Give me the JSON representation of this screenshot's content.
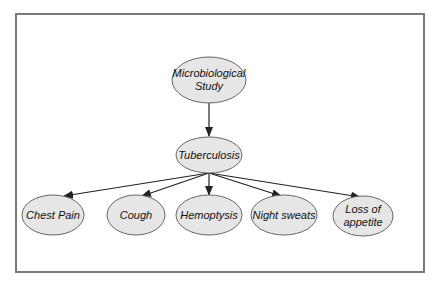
{
  "diagram": {
    "type": "directed-graph",
    "colors": {
      "node_fill": "#e6e6e6",
      "node_stroke": "#666666",
      "edge": "#222222",
      "frame": "#7a7a7a"
    },
    "nodes": [
      {
        "id": "micro",
        "lines": [
          "Microbiological",
          "Study"
        ]
      },
      {
        "id": "tb",
        "lines": [
          "Tuberculosis"
        ]
      },
      {
        "id": "chest",
        "lines": [
          "Chest Pain"
        ]
      },
      {
        "id": "cough",
        "lines": [
          "Cough"
        ]
      },
      {
        "id": "hemo",
        "lines": [
          "Hemoptysis"
        ]
      },
      {
        "id": "night",
        "lines": [
          "Night sweats"
        ]
      },
      {
        "id": "loss",
        "lines": [
          "Loss of",
          "appetite"
        ]
      }
    ],
    "edges": [
      {
        "from": "micro",
        "to": "tb"
      },
      {
        "from": "tb",
        "to": "chest"
      },
      {
        "from": "tb",
        "to": "cough"
      },
      {
        "from": "tb",
        "to": "hemo"
      },
      {
        "from": "tb",
        "to": "night"
      },
      {
        "from": "tb",
        "to": "loss"
      }
    ]
  }
}
